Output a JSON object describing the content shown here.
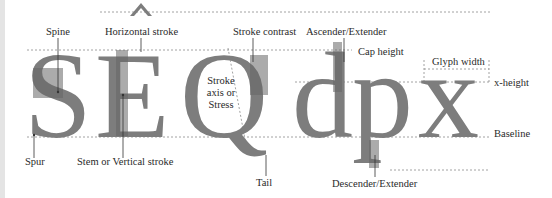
{
  "diagram": {
    "glyphs": [
      "S",
      "Ê",
      "Q",
      "d",
      "p",
      "x"
    ],
    "colors": {
      "glyph_fill": "#7d7d7d",
      "glyph_dark": "#676767",
      "guide_line": "#8a8a8a",
      "leader_line": "#333333",
      "label_text": "#2a2a2a"
    },
    "labels": {
      "spine": "Spine",
      "horizontal_stroke": "Horizontal stroke",
      "stroke_contrast": "Stroke contrast",
      "ascender": "Ascender/Extender",
      "cap_height": "Cap height",
      "glyph_width": "Glyph width",
      "x_height": "x-height",
      "baseline": "Baseline",
      "stroke_axis_line1": "Stroke",
      "stroke_axis_line2": "axis or",
      "stroke_axis_line3": "Stress",
      "spur": "Spur",
      "stem": "Stem or Vertical stroke",
      "tail": "Tail",
      "descender": "Descender/Extender"
    }
  }
}
